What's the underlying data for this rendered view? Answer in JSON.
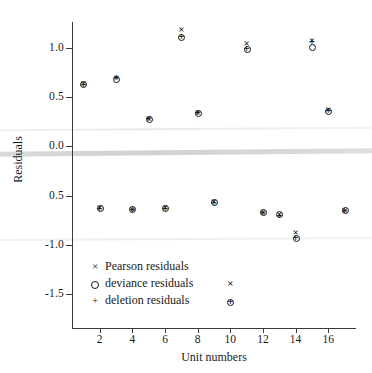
{
  "chart_data": {
    "type": "scatter",
    "title": "",
    "xlabel": "Unit numbers",
    "ylabel": "Residuals",
    "xlim": [
      0.3,
      17.7
    ],
    "ylim": [
      -1.72,
      1.32
    ],
    "xticks": [
      2,
      4,
      6,
      8,
      10,
      12,
      14,
      16
    ],
    "xtick_labels": [
      "2",
      "4",
      "6",
      "8",
      "10",
      "12",
      "14",
      "16"
    ],
    "yticks": [
      1.0,
      0.5,
      0.0,
      -0.5,
      -1.0,
      -1.5
    ],
    "ytick_labels": [
      "1.0",
      "0.5",
      "0.0",
      "0.5",
      "-1.0",
      "-1.5"
    ],
    "grid": false,
    "legend_position": "lower-left-inside",
    "x": [
      1,
      2,
      3,
      4,
      5,
      6,
      7,
      8,
      9,
      10,
      11,
      12,
      13,
      14,
      15,
      16,
      17
    ],
    "series": [
      {
        "name": "Pearson residuals",
        "marker": "x",
        "values": [
          0.64,
          -0.62,
          0.7,
          -0.64,
          0.28,
          -0.62,
          1.19,
          0.34,
          -0.56,
          -1.39,
          1.05,
          -0.67,
          -0.69,
          -0.87,
          1.08,
          0.37,
          -0.65
        ]
      },
      {
        "name": "deviance residuals",
        "marker": "o",
        "values": [
          0.63,
          -0.63,
          0.69,
          -0.64,
          0.28,
          -0.63,
          1.11,
          0.34,
          -0.57,
          -1.58,
          0.99,
          -0.67,
          -0.69,
          -0.93,
          1.01,
          0.36,
          -0.65
        ]
      },
      {
        "name": "deletion residuals",
        "marker": "+",
        "values": [
          0.63,
          -0.63,
          0.7,
          -0.64,
          0.28,
          -0.63,
          1.12,
          0.34,
          -0.57,
          -1.58,
          1.0,
          -0.67,
          -0.7,
          -0.93,
          1.07,
          0.36,
          -0.65
        ]
      }
    ]
  },
  "legend": {
    "items": [
      {
        "glyph": "×",
        "label": "Pearson residuals"
      },
      {
        "glyph": "○",
        "label": "deviance residuals"
      },
      {
        "glyph": "+",
        "label": "deletion residuals"
      }
    ]
  },
  "colors": {
    "marker": "#141414",
    "axis": "#3a3a3a",
    "background": "#ffffff",
    "artifact_band": "#d4d4d4"
  }
}
